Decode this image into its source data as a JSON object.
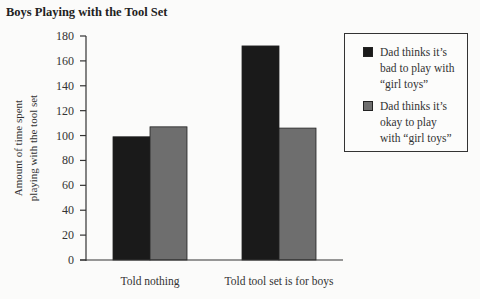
{
  "chart_data": {
    "type": "bar",
    "title": "Boys Playing with the Tool Set",
    "xlabel": "",
    "ylabel": "Amount of time spent playing with the tool set",
    "ylabel_lines": [
      "Amount of time spent",
      "playing with the tool set"
    ],
    "ylim": [
      0,
      180
    ],
    "yticks": [
      0,
      20,
      40,
      60,
      80,
      100,
      120,
      140,
      160,
      180
    ],
    "grid": false,
    "legend_position": "right",
    "categories": [
      "Told nothing",
      "Told tool set is for boys"
    ],
    "series": [
      {
        "name": "Dad thinks it’s bad to play with “girl toys”",
        "legend_lines": [
          "Dad thinks it’s",
          "bad to play with",
          "“girl toys”"
        ],
        "color": "#1a1a1a",
        "values": [
          99,
          172
        ]
      },
      {
        "name": "Dad thinks it’s okay to play with “girl toys”",
        "legend_lines": [
          "Dad thinks it’s",
          "okay to play",
          "with “girl toys”"
        ],
        "color": "#6e6e6e",
        "values": [
          107,
          106
        ]
      }
    ]
  }
}
